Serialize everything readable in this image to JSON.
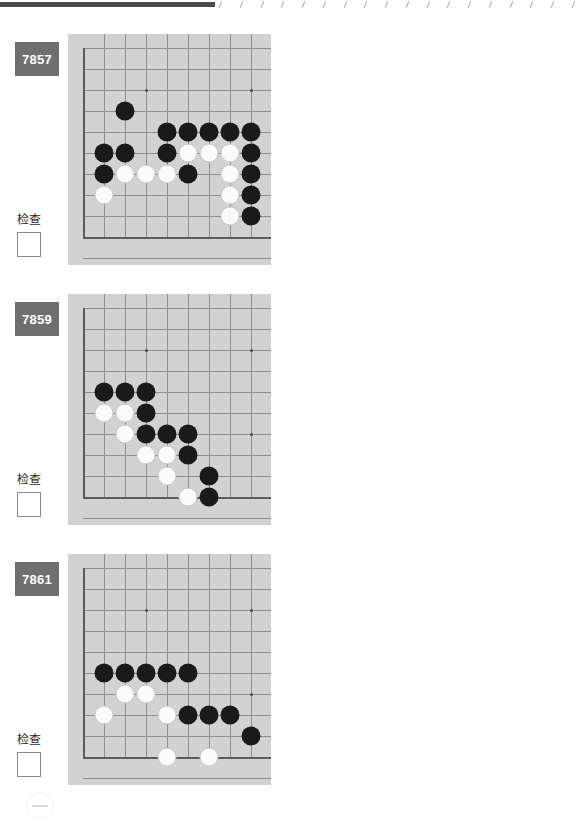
{
  "page": {
    "header_tick_count": 18,
    "bottom_mark_name": "page-footer-mark"
  },
  "colors": {
    "board_background": "#d2d2d2",
    "grid_line": "#8e8e8e",
    "board_edge": "#5c5c5c",
    "black_stone": "#1a1a1a",
    "white_stone": "#fbfbfb",
    "id_badge_background": "#6f6f6f",
    "id_badge_text": "#ffffff",
    "page_background": "#ffffff"
  },
  "labels": {
    "check_label": "检查",
    "checkbox_value": ""
  },
  "board_geometry": {
    "cols": 9,
    "rows": 10,
    "cell_size": 21,
    "origin_x": 15,
    "origin_y": 14,
    "hoshi_points": [
      [
        3,
        2
      ],
      [
        8,
        2
      ],
      [
        8,
        6
      ]
    ],
    "edge_lines": {
      "left_col": 0,
      "bottom_row": 9
    }
  },
  "problems": [
    {
      "id": "7857",
      "check_label": "检查",
      "stones": [
        {
          "color": "b",
          "col": 2,
          "row": 3
        },
        {
          "color": "b",
          "col": 4,
          "row": 4
        },
        {
          "color": "b",
          "col": 5,
          "row": 4
        },
        {
          "color": "b",
          "col": 6,
          "row": 4
        },
        {
          "color": "b",
          "col": 7,
          "row": 4
        },
        {
          "color": "b",
          "col": 8,
          "row": 4
        },
        {
          "color": "b",
          "col": 1,
          "row": 5
        },
        {
          "color": "b",
          "col": 2,
          "row": 5
        },
        {
          "color": "b",
          "col": 4,
          "row": 5
        },
        {
          "color": "w",
          "col": 5,
          "row": 5
        },
        {
          "color": "w",
          "col": 6,
          "row": 5
        },
        {
          "color": "w",
          "col": 7,
          "row": 5
        },
        {
          "color": "b",
          "col": 8,
          "row": 5
        },
        {
          "color": "b",
          "col": 1,
          "row": 6
        },
        {
          "color": "w",
          "col": 2,
          "row": 6
        },
        {
          "color": "w",
          "col": 3,
          "row": 6
        },
        {
          "color": "w",
          "col": 4,
          "row": 6
        },
        {
          "color": "b",
          "col": 5,
          "row": 6
        },
        {
          "color": "w",
          "col": 7,
          "row": 6
        },
        {
          "color": "b",
          "col": 8,
          "row": 6
        },
        {
          "color": "w",
          "col": 1,
          "row": 7
        },
        {
          "color": "w",
          "col": 7,
          "row": 7
        },
        {
          "color": "b",
          "col": 8,
          "row": 7
        },
        {
          "color": "w",
          "col": 7,
          "row": 8
        },
        {
          "color": "b",
          "col": 8,
          "row": 8
        }
      ]
    },
    {
      "id": "7858",
      "check_label": "检查",
      "stones": [
        {
          "color": "w",
          "col": 3,
          "row": 4
        },
        {
          "color": "w",
          "col": 1,
          "row": 5
        },
        {
          "color": "w",
          "col": 2,
          "row": 5
        },
        {
          "color": "w",
          "col": 4,
          "row": 5
        },
        {
          "color": "w",
          "col": 5,
          "row": 5
        },
        {
          "color": "b",
          "col": 4,
          "row": 6
        },
        {
          "color": "w",
          "col": 6,
          "row": 6
        },
        {
          "color": "w",
          "col": 7,
          "row": 6
        },
        {
          "color": "b",
          "col": 1,
          "row": 7
        },
        {
          "color": "w",
          "col": 7,
          "row": 7
        },
        {
          "color": "w",
          "col": 3,
          "row": 8
        },
        {
          "color": "b",
          "col": 5,
          "row": 8
        },
        {
          "color": "b",
          "col": 6,
          "row": 8
        },
        {
          "color": "w",
          "col": 7,
          "row": 8
        },
        {
          "color": "b",
          "col": 3,
          "row": 9
        },
        {
          "color": "w",
          "col": 5,
          "row": 9
        },
        {
          "color": "b",
          "col": 6,
          "row": 9
        },
        {
          "color": "w",
          "col": 7,
          "row": 9
        }
      ]
    },
    {
      "id": "7859",
      "check_label": "检查",
      "stones": [
        {
          "color": "b",
          "col": 1,
          "row": 4
        },
        {
          "color": "b",
          "col": 2,
          "row": 4
        },
        {
          "color": "b",
          "col": 3,
          "row": 4
        },
        {
          "color": "w",
          "col": 1,
          "row": 5
        },
        {
          "color": "w",
          "col": 2,
          "row": 5
        },
        {
          "color": "b",
          "col": 3,
          "row": 5
        },
        {
          "color": "w",
          "col": 2,
          "row": 6
        },
        {
          "color": "b",
          "col": 3,
          "row": 6
        },
        {
          "color": "b",
          "col": 4,
          "row": 6
        },
        {
          "color": "b",
          "col": 5,
          "row": 6
        },
        {
          "color": "w",
          "col": 3,
          "row": 7
        },
        {
          "color": "w",
          "col": 4,
          "row": 7
        },
        {
          "color": "b",
          "col": 5,
          "row": 7
        },
        {
          "color": "w",
          "col": 4,
          "row": 8
        },
        {
          "color": "b",
          "col": 6,
          "row": 8
        },
        {
          "color": "w",
          "col": 5,
          "row": 9
        },
        {
          "color": "b",
          "col": 6,
          "row": 9
        }
      ]
    },
    {
      "id": "7860",
      "check_label": "检查",
      "stones": [
        {
          "color": "b",
          "col": 1,
          "row": 5
        },
        {
          "color": "b",
          "col": 2,
          "row": 5
        },
        {
          "color": "b",
          "col": 3,
          "row": 5
        },
        {
          "color": "b",
          "col": 4,
          "row": 5
        },
        {
          "color": "b",
          "col": 5,
          "row": 5
        },
        {
          "color": "b",
          "col": 6,
          "row": 5
        },
        {
          "color": "b",
          "col": 7,
          "row": 5
        },
        {
          "color": "w",
          "col": 1,
          "row": 6
        },
        {
          "color": "w",
          "col": 2,
          "row": 6
        },
        {
          "color": "w",
          "col": 3,
          "row": 6
        },
        {
          "color": "w",
          "col": 4,
          "row": 6
        },
        {
          "color": "w",
          "col": 5,
          "row": 6
        },
        {
          "color": "w",
          "col": 6,
          "row": 6
        },
        {
          "color": "b",
          "col": 7,
          "row": 6
        },
        {
          "color": "b",
          "col": 1,
          "row": 7
        },
        {
          "color": "b",
          "col": 2,
          "row": 7
        },
        {
          "color": "b",
          "col": 4,
          "row": 7
        },
        {
          "color": "b",
          "col": 5,
          "row": 7
        },
        {
          "color": "w",
          "col": 6,
          "row": 7
        },
        {
          "color": "b",
          "col": 7,
          "row": 7
        },
        {
          "color": "w",
          "col": 6,
          "row": 8
        },
        {
          "color": "b",
          "col": 7,
          "row": 8
        },
        {
          "color": "b",
          "col": 10,
          "row": 8
        },
        {
          "color": "w",
          "col": 1,
          "row": 9
        },
        {
          "color": "w",
          "col": 6,
          "row": 9
        }
      ]
    },
    {
      "id": "7861",
      "check_label": "检查",
      "stones": [
        {
          "color": "b",
          "col": 1,
          "row": 5
        },
        {
          "color": "b",
          "col": 2,
          "row": 5
        },
        {
          "color": "b",
          "col": 3,
          "row": 5
        },
        {
          "color": "b",
          "col": 4,
          "row": 5
        },
        {
          "color": "b",
          "col": 5,
          "row": 5
        },
        {
          "color": "w",
          "col": 2,
          "row": 6
        },
        {
          "color": "w",
          "col": 3,
          "row": 6
        },
        {
          "color": "w",
          "col": 1,
          "row": 7
        },
        {
          "color": "w",
          "col": 4,
          "row": 7
        },
        {
          "color": "b",
          "col": 5,
          "row": 7
        },
        {
          "color": "b",
          "col": 6,
          "row": 7
        },
        {
          "color": "b",
          "col": 7,
          "row": 7
        },
        {
          "color": "b",
          "col": 8,
          "row": 8
        },
        {
          "color": "w",
          "col": 4,
          "row": 9
        },
        {
          "color": "w",
          "col": 6,
          "row": 9
        }
      ]
    },
    {
      "id": "7862",
      "check_label": "检查",
      "stones": [
        {
          "color": "b",
          "col": 4,
          "row": 5
        },
        {
          "color": "b",
          "col": 5,
          "row": 5
        },
        {
          "color": "b",
          "col": 6,
          "row": 5
        },
        {
          "color": "b",
          "col": 7,
          "row": 5
        },
        {
          "color": "b",
          "col": 2,
          "row": 6
        },
        {
          "color": "b",
          "col": 4,
          "row": 6
        },
        {
          "color": "w",
          "col": 5,
          "row": 6
        },
        {
          "color": "w",
          "col": 6,
          "row": 6
        },
        {
          "color": "w",
          "col": 7,
          "row": 6
        },
        {
          "color": "b",
          "col": 8,
          "row": 6
        },
        {
          "color": "b",
          "col": 9,
          "row": 6
        },
        {
          "color": "b",
          "col": 3,
          "row": 7
        },
        {
          "color": "w",
          "col": 4,
          "row": 7
        },
        {
          "color": "w",
          "col": 7,
          "row": 7
        },
        {
          "color": "w",
          "col": 8,
          "row": 7
        },
        {
          "color": "b",
          "col": 9,
          "row": 7
        },
        {
          "color": "w",
          "col": 4,
          "row": 8
        },
        {
          "color": "w",
          "col": 8,
          "row": 8
        },
        {
          "color": "b",
          "col": 9,
          "row": 8
        },
        {
          "color": "b",
          "col": 7,
          "row": 9
        },
        {
          "color": "w",
          "col": 8,
          "row": 9
        },
        {
          "color": "b",
          "col": 9,
          "row": 9
        }
      ]
    }
  ]
}
